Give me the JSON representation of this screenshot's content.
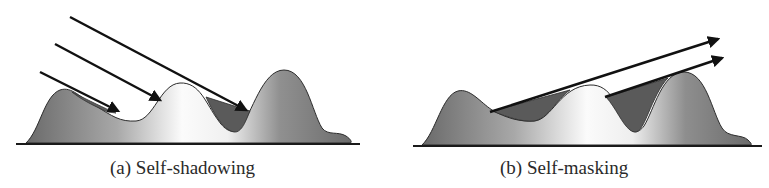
{
  "figure": {
    "panels": [
      {
        "id": "a",
        "caption": "(a) Self-shadowing",
        "concept": "self-shadowing",
        "arrow_count": 3,
        "arrow_direction": "incoming light rays hitting surface"
      },
      {
        "id": "b",
        "caption": "(b) Self-masking",
        "concept": "self-masking",
        "arrow_count": 2,
        "arrow_direction": "outgoing view rays leaving surface"
      }
    ],
    "colors": {
      "background": "#ffffff",
      "surface_dark": "#6e6e6e",
      "surface_light": "#fafafa",
      "shadow_region": "#5a5a5a",
      "outline": "#2b2b2b",
      "arrow": "#111111",
      "baseline": "#1a1a1a"
    }
  }
}
